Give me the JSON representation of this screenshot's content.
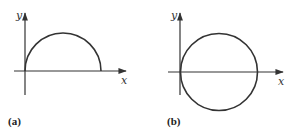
{
  "panels": [
    {
      "id": "a",
      "label": "(a)",
      "x_axis_label": "x",
      "y_axis_label": "y",
      "curve": "semicircle (upper half) starting at origin"
    },
    {
      "id": "b",
      "label": "(b)",
      "x_axis_label": "x",
      "y_axis_label": "y",
      "curve": "full circle tangent to y-axis at origin"
    }
  ],
  "colors": {
    "stroke": "#333333",
    "background": "#ffffff"
  }
}
